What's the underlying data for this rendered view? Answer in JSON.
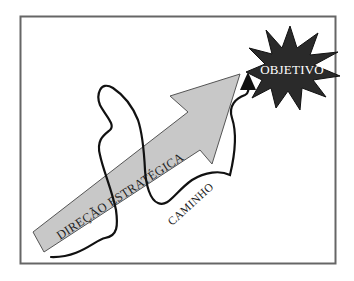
{
  "diagram": {
    "goal": {
      "label": "OBJETIVO",
      "fill": "#2a2a2a",
      "text_color": "#ffffff"
    },
    "strategic_direction": {
      "label": "DIREÇÃO ESTRATÉGICA",
      "fill": "#c8c8c8",
      "stroke": "#555555"
    },
    "path": {
      "label": "CAMINHO",
      "stroke": "#111111"
    },
    "frame": {
      "stroke": "#666666"
    }
  }
}
